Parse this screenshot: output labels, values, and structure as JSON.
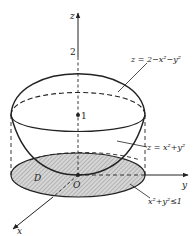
{
  "diagram": {
    "title": "",
    "axes": {
      "z_label": "z",
      "y_label": "y",
      "x_label": "x",
      "origin_label": "O"
    },
    "marks": {
      "z_top_value": "2",
      "z_center_value": "1"
    },
    "surfaces": {
      "upper": "z = 2−x²−y²",
      "lower": "z = x²+y²"
    },
    "region": {
      "name": "D",
      "inequality": "x²+y²≤1"
    },
    "colors": {
      "stroke": "#222222",
      "region_fill": "#c8c8c8"
    }
  }
}
